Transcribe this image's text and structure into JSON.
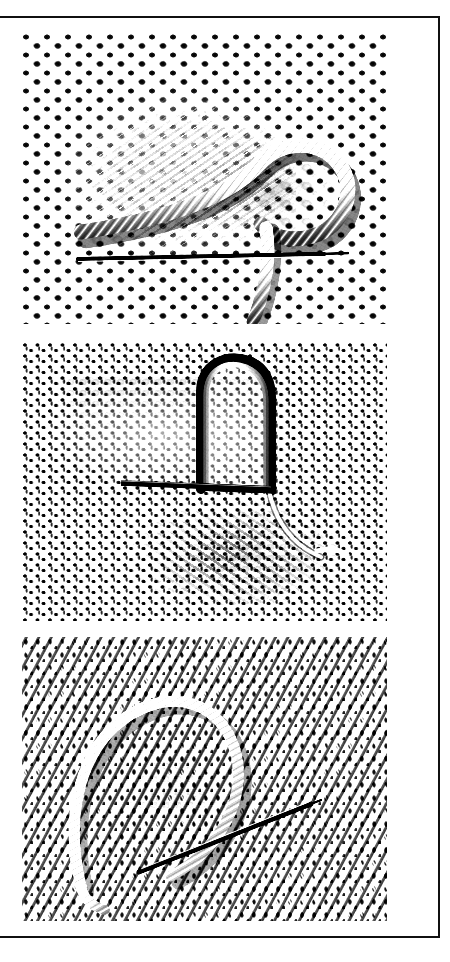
{
  "document": {
    "kind": "scanned-figure-plate",
    "orientation": "portrait",
    "page_background": "#ffffff",
    "border_color": "#101010",
    "border_width_px": 2,
    "caption": "",
    "page_number": ""
  },
  "plate": {
    "panel_count": 3,
    "panels": [
      {
        "id": "figure-1",
        "label": "",
        "subject": "coarse honeycomb mesh fabric with thick cord loop and needle",
        "fabric": "honeycomb-bobble-mesh",
        "tone": "high-contrast black and white photograph",
        "features": [
          "large open honeycomb net",
          "thick twisted cord laid diagonally across the mesh",
          "cord forms a rounded loop at right",
          "straight dark needle lying horizontally below the loop",
          "cord tail descending to bottom right"
        ],
        "rect": {
          "x": 25,
          "y": 30,
          "w": 367,
          "h": 293
        }
      },
      {
        "id": "figure-2",
        "label": "",
        "subject": "fine wishbone rib mesh with upright cord loop and needle",
        "fabric": "fine-rib-wishbone-mesh",
        "tone": "high-contrast black and white photograph",
        "features": [
          "fine T-shaped rib knit net",
          "tall narrow upright loop of cord near centre-right",
          "heavy straight needle crossing horizontally at mid height",
          "shaded diagonal band of lifted fabric across the centre",
          "cord tail running down to the lower right"
        ],
        "rect": {
          "x": 25,
          "y": 339,
          "w": 367,
          "h": 281
        }
      },
      {
        "id": "figure-3",
        "label": "",
        "subject": "dense diagonal knit jersey with cord loop and angled needle",
        "fabric": "dense-diagonal-knit",
        "tone": "high-contrast black and white photograph",
        "features": [
          "dense diagonally-ribbed knit structure",
          "large rounded cord loop in the centre",
          "long thin needle angled from lower-left to upper-right",
          "cord tail exiting at the bottom left"
        ],
        "rect": {
          "x": 25,
          "y": 634,
          "w": 367,
          "h": 286
        }
      }
    ]
  },
  "colors": {
    "ink": "#101010",
    "paper": "#ffffff",
    "panel_paper": "#fbfbfb",
    "mesh_dark": "#141414",
    "mesh_mid": "#9a9a9a",
    "mesh_light": "#f2f2f2",
    "needle": "#0a0a0a",
    "cord_light": "#f4f4f4",
    "cord_shadow": "#6f6f6f"
  }
}
